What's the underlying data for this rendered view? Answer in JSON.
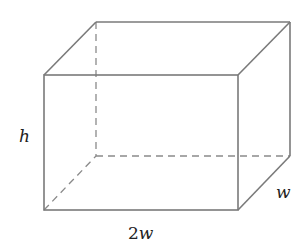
{
  "diagram": {
    "labels": {
      "height": "h",
      "depth": "w",
      "length_coef": "2",
      "length_var": "w"
    },
    "colors": {
      "edge": "#7a7a7a",
      "hidden_edge": "#8a8a8a",
      "text": "#222222",
      "background": "#ffffff"
    }
  }
}
